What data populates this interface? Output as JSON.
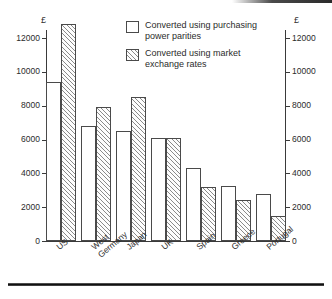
{
  "chart_data": {
    "type": "bar",
    "title": "",
    "xlabel": "",
    "ylabel": "£",
    "ylabel_right": "£",
    "ylim": [
      0,
      13000
    ],
    "yticks": [
      0,
      2000,
      4000,
      6000,
      8000,
      10000,
      12000
    ],
    "ytick_labels": [
      "0",
      "2000",
      "4000",
      "6000",
      "8000",
      "10000",
      "12000"
    ],
    "grid": false,
    "legend_position": "top-center",
    "categories": [
      "US",
      "West Germany",
      "Japan",
      "UK",
      "Spain",
      "Greece",
      "Portugal"
    ],
    "series": [
      {
        "name": "Converted using purchasing power parities",
        "style": "open",
        "values": [
          9400,
          6800,
          6500,
          6100,
          4300,
          3250,
          2750
        ]
      },
      {
        "name": "Converted using market exchange rates",
        "style": "hatched",
        "values": [
          12800,
          7900,
          8500,
          6100,
          3200,
          2400,
          1450
        ]
      }
    ]
  },
  "legend": {
    "items": [
      {
        "label_line1": "Converted using purchasing",
        "label_line2": "power parities",
        "swatch": "open-square-icon"
      },
      {
        "label_line1": "Converted using market",
        "label_line2": "exchange rates",
        "swatch": "hatched-square-icon"
      }
    ]
  },
  "axes": {
    "left": {
      "unit": "£",
      "ticks": [
        "12000",
        "10000",
        "8000",
        "6000",
        "4000",
        "2000",
        "0"
      ]
    },
    "right": {
      "unit": "£",
      "ticks": [
        "12000",
        "10000",
        "8000",
        "6000",
        "4000",
        "2000",
        "0"
      ]
    }
  },
  "xaxis": {
    "labels": [
      {
        "line1": "US",
        "line2": ""
      },
      {
        "line1": "West",
        "line2": "Germany"
      },
      {
        "line1": "Japan",
        "line2": ""
      },
      {
        "line1": "UK",
        "line2": ""
      },
      {
        "line1": "Spain",
        "line2": ""
      },
      {
        "line1": "Greece",
        "line2": ""
      },
      {
        "line1": "Portugal",
        "line2": ""
      }
    ]
  },
  "colors": {
    "ink": "#2b2b2b",
    "axis": "#3a3a3a",
    "bar_border": "#4a4a4a",
    "hatch": "#8a8a8a",
    "background": "#ffffff"
  }
}
